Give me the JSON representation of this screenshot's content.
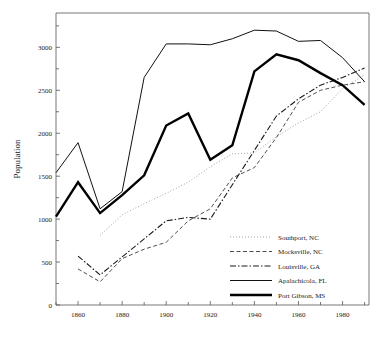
{
  "chart_data": {
    "type": "line",
    "title": "",
    "xlabel": "",
    "ylabel": "Population",
    "xlim": [
      1850,
      1992
    ],
    "ylim": [
      0,
      3400
    ],
    "grid": false,
    "legend_position": "inside-lower-right",
    "x_major_ticks": [
      1860,
      1880,
      1900,
      1920,
      1940,
      1960,
      1980
    ],
    "x_minor_ticks": [
      1850,
      1870,
      1890,
      1910,
      1930,
      1950,
      1970,
      1990
    ],
    "x_tick_labels": [
      "1860",
      "1880",
      "1900",
      "1920",
      "1940",
      "1960",
      "1980"
    ],
    "y_major_ticks": [
      0,
      500,
      1000,
      1500,
      2000,
      2500,
      3000
    ],
    "y_tick_labels": [
      "0",
      "500",
      "1000",
      "1500",
      "2000",
      "2500",
      "3000"
    ],
    "y_minor_ticks": [
      250,
      750,
      1250,
      1750,
      2250,
      2750,
      3250
    ],
    "series": [
      {
        "name": "Southport, NC",
        "style": "dotted",
        "color": "#9a9a9a",
        "width": 0.9,
        "x": [
          1870,
          1880,
          1890,
          1900,
          1910,
          1920,
          1930,
          1940,
          1950,
          1960,
          1970,
          1980,
          1990
        ],
        "values": [
          810,
          1050,
          1180,
          1300,
          1430,
          1610,
          1760,
          1770,
          1960,
          2120,
          2250,
          2520,
          2680
        ]
      },
      {
        "name": "Mocksville, NC",
        "style": "dashed",
        "color": "#3a3a3a",
        "width": 0.9,
        "x": [
          1860,
          1870,
          1880,
          1890,
          1900,
          1910,
          1920,
          1930,
          1940,
          1950,
          1960,
          1970,
          1980,
          1990
        ],
        "values": [
          420,
          270,
          540,
          650,
          730,
          980,
          1120,
          1480,
          1600,
          1950,
          2360,
          2500,
          2560,
          2600
        ]
      },
      {
        "name": "Louisville, GA",
        "style": "dashdot",
        "color": "#1a1a1a",
        "width": 1.1,
        "x": [
          1860,
          1870,
          1880,
          1890,
          1900,
          1910,
          1920,
          1930,
          1940,
          1950,
          1960,
          1970,
          1980,
          1990
        ],
        "values": [
          570,
          350,
          560,
          770,
          980,
          1020,
          1000,
          1400,
          1800,
          2200,
          2400,
          2560,
          2650,
          2760
        ]
      },
      {
        "name": "Apalachicola, FL",
        "style": "solid",
        "color": "#111111",
        "width": 1.0,
        "x": [
          1850,
          1860,
          1870,
          1880,
          1890,
          1900,
          1910,
          1920,
          1930,
          1940,
          1950,
          1960,
          1970,
          1980,
          1990
        ],
        "values": [
          1540,
          1890,
          1120,
          1320,
          2650,
          3040,
          3040,
          3030,
          3100,
          3200,
          3190,
          3070,
          3080,
          2880,
          2600
        ]
      },
      {
        "name": "Port Gibson, MS",
        "style": "solid",
        "color": "#000000",
        "width": 2.4,
        "x": [
          1850,
          1860,
          1870,
          1880,
          1890,
          1900,
          1910,
          1920,
          1930,
          1940,
          1950,
          1960,
          1970,
          1980,
          1990
        ],
        "values": [
          1030,
          1430,
          1070,
          1280,
          1510,
          2090,
          2230,
          1690,
          1860,
          2720,
          2920,
          2850,
          2700,
          2560,
          2330
        ]
      }
    ]
  },
  "legend": {
    "entries": [
      {
        "label": "Southport, NC"
      },
      {
        "label": "Mocksville, NC"
      },
      {
        "label": "Louisville, GA"
      },
      {
        "label": "Apalachicola, FL"
      },
      {
        "label": "Port Gibson, MS"
      }
    ]
  }
}
